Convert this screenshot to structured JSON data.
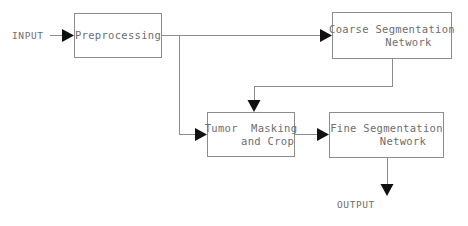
{
  "diagram": {
    "canvas": {
      "width": 468,
      "height": 226,
      "background": "#ffffff"
    },
    "colors": {
      "box_border": "#8c8c8c",
      "text": "#6e6e6e",
      "edge": "#8c8c8c",
      "arrow_head": "#111111"
    },
    "io": {
      "input_label": "INPUT",
      "output_label": "OUTPUT"
    },
    "nodes": [
      {
        "id": "preprocessing",
        "label": "Preprocessing",
        "x": 74,
        "y": 13,
        "w": 88,
        "h": 45
      },
      {
        "id": "coarse-segmentation-network",
        "label": "Coarse Segmentation\n     Network",
        "x": 332,
        "y": 12,
        "w": 120,
        "h": 47
      },
      {
        "id": "tumor-masking-and-crop",
        "label": "Tumor  Masking\n     and Crop",
        "x": 207,
        "y": 112,
        "w": 88,
        "h": 45
      },
      {
        "id": "fine-segmentation-network",
        "label": "Fine Segmentation\n     Network",
        "x": 329,
        "y": 112,
        "w": 115,
        "h": 46
      }
    ],
    "edges": [
      {
        "id": "input-to-preprocessing",
        "from": "INPUT",
        "to": "preprocessing"
      },
      {
        "id": "preprocessing-to-coarse",
        "from": "preprocessing",
        "to": "coarse-segmentation-network"
      },
      {
        "id": "preprocessing-to-tumor-masking",
        "from": "preprocessing",
        "to": "tumor-masking-and-crop"
      },
      {
        "id": "coarse-to-tumor-masking",
        "from": "coarse-segmentation-network",
        "to": "tumor-masking-and-crop"
      },
      {
        "id": "tumor-masking-to-fine",
        "from": "tumor-masking-and-crop",
        "to": "fine-segmentation-network"
      },
      {
        "id": "fine-to-output",
        "from": "fine-segmentation-network",
        "to": "OUTPUT"
      }
    ]
  }
}
